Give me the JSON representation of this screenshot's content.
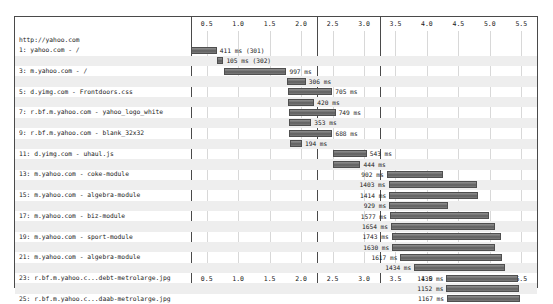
{
  "chart_data": {
    "type": "bar",
    "title": "",
    "subtitle": "",
    "xlabel": "",
    "ylabel": "",
    "orientation": "horizontal",
    "style": "waterfall",
    "xlim": [
      0.25,
      5.75
    ],
    "grid": true,
    "legend": null,
    "axis_unit": "seconds",
    "tick_labels": [
      "0.5",
      "1.0",
      "1.5",
      "2.0",
      "2.5",
      "3.0",
      "3.5",
      "4.0",
      "4.5",
      "5.0",
      "5.5"
    ],
    "tick_values": [
      0.5,
      1.0,
      1.5,
      2.0,
      2.5,
      3.0,
      3.5,
      4.0,
      4.5,
      5.0,
      5.5
    ],
    "panel_breaks": [
      2.25,
      3.25
    ],
    "header": "http://yahoo.com",
    "categories": [
      "1: yahoo.com - /",
      "2: www.yahoo.com - /",
      "3: m.yahoo.com - /",
      "4: us.il.yimg.com - web-app.css",
      "5: d.yimg.com - Frontdoors.css",
      "6: d.yimg.com - combo",
      "7: r.bf.m.yahoo.com - yahoo_logo_white",
      "8: ads.yimg.com - 380597.gif",
      "9: r.bf.m.yahoo.com - blank_32x32",
      "10: us.il.yimg.com - web-app-min.js",
      "11: d.yimg.com - uhaul.js",
      "12: d.yimg.com - combo",
      "13: m.yahoo.com - coke-module",
      "14: m.yahoo.com - algebra-module",
      "15: m.yahoo.com - algebra-module",
      "16: m.yahoo.com - news-module-hero",
      "17: m.yahoo.com - biz-module",
      "18: m.yahoo.com - ent-module",
      "19: m.yahoo.com - sport-module",
      "20: m.yahoo.com - video-module",
      "21: m.yahoo.com - algebra-module",
      "22: r.bf.m.yahoo.c...-smile-getty-lg.jpg",
      "23: r.bf.m.yahoo.c...debt-metrolarge.jpg",
      "24: r.bf.m.yahoo.c...pule-metrolarge.jpg",
      "25: r.bf.m.yahoo.c...daab-metrolarge.jpg"
    ],
    "bars": [
      {
        "index": 1,
        "start": 0.25,
        "duration_ms": 411,
        "label": "411 ms (301)",
        "label_side": "right"
      },
      {
        "index": 2,
        "start": 0.66,
        "duration_ms": 105,
        "label": "105 ms (302)",
        "label_side": "right"
      },
      {
        "index": 3,
        "start": 0.77,
        "duration_ms": 997,
        "label": "997 ms",
        "label_side": "right"
      },
      {
        "index": 4,
        "start": 1.77,
        "duration_ms": 306,
        "label": "306 ms",
        "label_side": "right"
      },
      {
        "index": 5,
        "start": 1.79,
        "duration_ms": 705,
        "label": "705 ms",
        "label_side": "right"
      },
      {
        "index": 6,
        "start": 1.79,
        "duration_ms": 420,
        "label": "420 ms",
        "label_side": "right"
      },
      {
        "index": 7,
        "start": 1.8,
        "duration_ms": 749,
        "label": "749 ms",
        "label_side": "right"
      },
      {
        "index": 8,
        "start": 1.81,
        "duration_ms": 353,
        "label": "353 ms",
        "label_side": "right"
      },
      {
        "index": 9,
        "start": 1.81,
        "duration_ms": 688,
        "label": "688 ms",
        "label_side": "right"
      },
      {
        "index": 10,
        "start": 1.82,
        "duration_ms": 194,
        "label": "194 ms",
        "label_side": "right"
      },
      {
        "index": 11,
        "start": 2.5,
        "duration_ms": 543,
        "label": "543 ms",
        "label_side": "right"
      },
      {
        "index": 12,
        "start": 2.5,
        "duration_ms": 444,
        "label": "444 ms",
        "label_side": "right"
      },
      {
        "index": 13,
        "start": 3.36,
        "duration_ms": 902,
        "label": "902 ms",
        "label_side": "left"
      },
      {
        "index": 14,
        "start": 3.39,
        "duration_ms": 1403,
        "label": "1403 ms",
        "label_side": "left"
      },
      {
        "index": 15,
        "start": 3.4,
        "duration_ms": 1414,
        "label": "1414 ms",
        "label_side": "left"
      },
      {
        "index": 16,
        "start": 3.4,
        "duration_ms": 929,
        "label": "929 ms",
        "label_side": "left"
      },
      {
        "index": 17,
        "start": 3.41,
        "duration_ms": 1577,
        "label": "1577 ms",
        "label_side": "left"
      },
      {
        "index": 18,
        "start": 3.43,
        "duration_ms": 1654,
        "label": "1654 ms",
        "label_side": "left"
      },
      {
        "index": 19,
        "start": 3.44,
        "duration_ms": 1743,
        "label": "1743 ms",
        "label_side": "left"
      },
      {
        "index": 20,
        "start": 3.45,
        "duration_ms": 1630,
        "label": "1630 ms",
        "label_side": "left"
      },
      {
        "index": 21,
        "start": 3.58,
        "duration_ms": 1617,
        "label": "1617 ms",
        "label_side": "left"
      },
      {
        "index": 22,
        "start": 3.8,
        "duration_ms": 1434,
        "label": "1434 ms",
        "label_side": "left"
      },
      {
        "index": 23,
        "start": 4.31,
        "duration_ms": 1135,
        "label": "1135 ms",
        "label_side": "left"
      },
      {
        "index": 24,
        "start": 4.31,
        "duration_ms": 1152,
        "label": "1152 ms",
        "label_side": "left"
      },
      {
        "index": 25,
        "start": 4.32,
        "duration_ms": 1167,
        "label": "1167 ms",
        "label_side": "left"
      }
    ]
  },
  "colors": {
    "bar_fill": "#6f6f6f",
    "bar_border": "#4f4f4f",
    "frame": "#4a4a4a",
    "gridline": "#d8d8d8",
    "stripe": "#eeeeee",
    "text": "#1a1a1a",
    "background": "#ffffff"
  }
}
